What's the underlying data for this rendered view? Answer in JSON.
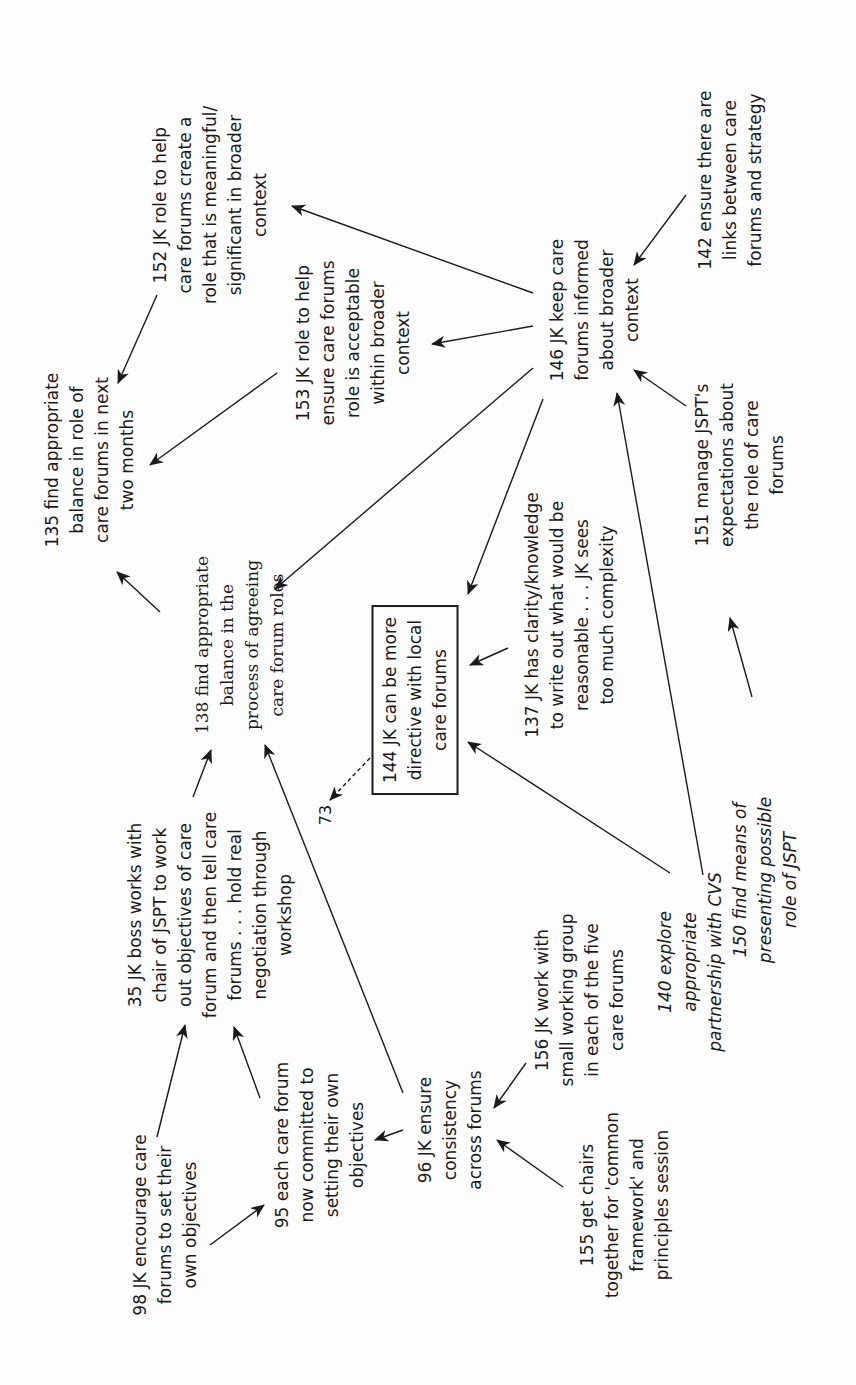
{
  "diagram": {
    "type": "cognitive-map",
    "orientation": "rotated -90deg",
    "colors": {
      "ink": "#1a1a1a",
      "background": "#fdfdfd"
    },
    "nodes": [
      {
        "id": "152",
        "text": "152 JK role to help\ncare forums create a\nrole that is meaningful/\nsignificant in broader\ncontext",
        "x": 210,
        "y": 205,
        "style": "normal"
      },
      {
        "id": "153",
        "text": "153 JK role to help\nensure care forums\nrole is acceptable\nwithin broader\ncontext",
        "x": 353,
        "y": 343,
        "style": "normal"
      },
      {
        "id": "142",
        "text": "142 ensure there are\nlinks between care\nforums and strategy",
        "x": 730,
        "y": 180,
        "style": "normal"
      },
      {
        "id": "146",
        "text": "146 JK keep care\nforums informed\nabout broader\ncontext",
        "x": 595,
        "y": 310,
        "style": "normal"
      },
      {
        "id": "135",
        "text": "135 find appropriate\nbalance in role of\ncare forums in next\ntwo months",
        "x": 90,
        "y": 460,
        "style": "normal"
      },
      {
        "id": "151",
        "text": "151 manage JSPT's\nexpectations about\nthe role of care\nforums",
        "x": 740,
        "y": 465,
        "style": "normal"
      },
      {
        "id": "138",
        "text": "138 find appropriate\nbalance in the\nprocess of agreeing\ncare forum roles",
        "x": 240,
        "y": 645,
        "style": "serif"
      },
      {
        "id": "137",
        "text": "137 JK has clarity/knowledge\nto write out what would be\nreasonable . . . JK sees\ntoo much complexity",
        "x": 570,
        "y": 615,
        "style": "normal"
      },
      {
        "id": "144",
        "text": "144 JK can be more\ndirective with local\ncare forums",
        "x": 415,
        "y": 700,
        "style": "boxed"
      },
      {
        "id": "150",
        "text": "150 find means of\npresenting possible\nrole of JSPT",
        "x": 765,
        "y": 880,
        "style": "italic"
      },
      {
        "id": "73",
        "text": "73",
        "x": 325,
        "y": 815,
        "style": "small"
      },
      {
        "id": "35",
        "text": "35 JK boss works with\nchair of JSPT to work\nout objectives of care\nforum and then tell care\nforums . . . hold real\nnegotiation through\nworkshop",
        "x": 210,
        "y": 915,
        "style": "normal"
      },
      {
        "id": "156",
        "text": "156 JK work with\nsmall working group\nin each of the five\ncare forums",
        "x": 580,
        "y": 1000,
        "style": "normal"
      },
      {
        "id": "140",
        "text": "140 explore\nappropriate\npartnership with CVS",
        "x": 690,
        "y": 962,
        "style": "italic"
      },
      {
        "id": "95",
        "text": "95 each care forum\nnow committed to\nsetting their own\nobjectives",
        "x": 320,
        "y": 1145,
        "style": "normal"
      },
      {
        "id": "96",
        "text": "96 JK ensure\nconsistency\nacross forums",
        "x": 450,
        "y": 1130,
        "style": "normal"
      },
      {
        "id": "98",
        "text": "98 JK encourage care\nforums to set their\nown objectives",
        "x": 165,
        "y": 1225,
        "style": "normal"
      },
      {
        "id": "155",
        "text": "155 get chairs\ntogether for 'common\nframework' and\nprinciples session",
        "x": 625,
        "y": 1205,
        "style": "normal"
      }
    ],
    "edges": [
      {
        "from": "152",
        "to": "135",
        "x1": 157,
        "y1": 295,
        "x2": 118,
        "y2": 383,
        "dashed": false
      },
      {
        "from": "153",
        "to": "135",
        "x1": 277,
        "y1": 373,
        "x2": 150,
        "y2": 465,
        "dashed": false
      },
      {
        "from": "146",
        "to": "152",
        "x1": 533,
        "y1": 293,
        "x2": 292,
        "y2": 206,
        "dashed": false
      },
      {
        "from": "146",
        "to": "153",
        "x1": 533,
        "y1": 326,
        "x2": 432,
        "y2": 344,
        "dashed": false
      },
      {
        "from": "146",
        "to": "138",
        "x1": 533,
        "y1": 368,
        "x2": 275,
        "y2": 589,
        "dashed": false
      },
      {
        "from": "146",
        "to": "144",
        "x1": 543,
        "y1": 399,
        "x2": 468,
        "y2": 594,
        "dashed": false
      },
      {
        "from": "142",
        "to": "146",
        "x1": 686,
        "y1": 195,
        "x2": 634,
        "y2": 265,
        "dashed": false
      },
      {
        "from": "151",
        "to": "146",
        "x1": 686,
        "y1": 406,
        "x2": 634,
        "y2": 370,
        "dashed": false
      },
      {
        "from": "150",
        "to": "151",
        "x1": 752,
        "y1": 697,
        "x2": 730,
        "y2": 618,
        "dashed": false
      },
      {
        "from": "140",
        "to": "146",
        "x1": 703,
        "y1": 875,
        "x2": 617,
        "y2": 393,
        "dashed": false
      },
      {
        "from": "140",
        "to": "144",
        "x1": 670,
        "y1": 873,
        "x2": 468,
        "y2": 742,
        "dashed": false
      },
      {
        "from": "137",
        "to": "144",
        "x1": 508,
        "y1": 648,
        "x2": 470,
        "y2": 665,
        "dashed": false
      },
      {
        "from": "138",
        "to": "135",
        "x1": 160,
        "y1": 612,
        "x2": 117,
        "y2": 572,
        "dashed": false
      },
      {
        "from": "35",
        "to": "138",
        "x1": 193,
        "y1": 797,
        "x2": 211,
        "y2": 750,
        "dashed": false
      },
      {
        "from": "96",
        "to": "138",
        "x1": 403,
        "y1": 1093,
        "x2": 265,
        "y2": 745,
        "dashed": false
      },
      {
        "from": "144",
        "to": "73",
        "x1": 370,
        "y1": 758,
        "x2": 330,
        "y2": 800,
        "dashed": true
      },
      {
        "from": "98",
        "to": "35",
        "x1": 157,
        "y1": 1137,
        "x2": 185,
        "y2": 1025,
        "dashed": false
      },
      {
        "from": "95",
        "to": "35",
        "x1": 260,
        "y1": 1098,
        "x2": 234,
        "y2": 1027,
        "dashed": false
      },
      {
        "from": "98",
        "to": "95",
        "x1": 210,
        "y1": 1245,
        "x2": 264,
        "y2": 1205,
        "dashed": false
      },
      {
        "from": "96",
        "to": "95",
        "x1": 403,
        "y1": 1130,
        "x2": 375,
        "y2": 1140,
        "dashed": false
      },
      {
        "from": "156",
        "to": "96",
        "x1": 526,
        "y1": 1063,
        "x2": 494,
        "y2": 1108,
        "dashed": false
      },
      {
        "from": "155",
        "to": "96",
        "x1": 563,
        "y1": 1187,
        "x2": 497,
        "y2": 1140,
        "dashed": false
      }
    ]
  }
}
